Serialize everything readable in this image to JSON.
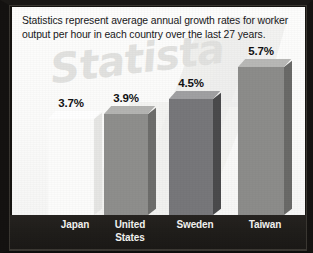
{
  "caption": "Statistics represent average annual growth rates for worker output per hour in each country over the last 27 years.",
  "watermark": "Statista",
  "chart_data": {
    "type": "bar",
    "title": "",
    "subtitle": "",
    "xlabel": "",
    "ylabel": "",
    "unit": "%",
    "grid": false,
    "legend": null,
    "ylim": [
      0,
      6.4
    ],
    "categories": [
      "Japan",
      "United States",
      "Sweden",
      "Taiwan"
    ],
    "values": [
      3.7,
      3.9,
      4.5,
      5.7
    ],
    "value_labels": [
      "3.7%",
      "3.9%",
      "4.5%",
      "5.7%"
    ],
    "bars": [
      {
        "category": "Japan",
        "label_line1": "Japan",
        "label_line2": "",
        "value": 3.7,
        "value_label": "3.7%",
        "x": 36,
        "width": 46,
        "height": 96,
        "face_color": "#fcfcfb",
        "top_color": "#ffffff",
        "side_color": "#e6e6e4"
      },
      {
        "category": "United States",
        "label_line1": "United",
        "label_line2": "States",
        "value": 3.9,
        "value_label": "3.9%",
        "x": 92,
        "width": 44,
        "height": 101,
        "face_color": "#8e8e8c",
        "top_color": "#b4b4b2",
        "side_color": "#6d6d6b"
      },
      {
        "category": "Sweden",
        "label_line1": "Sweden",
        "label_line2": "",
        "value": 4.5,
        "value_label": "4.5%",
        "x": 157,
        "width": 44,
        "height": 116,
        "face_color": "#77777a",
        "top_color": "#a0a0a2",
        "side_color": "#4a4a4c"
      },
      {
        "category": "Taiwan",
        "label_line1": "Taiwan",
        "label_line2": "",
        "value": 5.7,
        "value_label": "5.7%",
        "x": 226,
        "width": 46,
        "height": 148,
        "face_color": "#8c8c8a",
        "top_color": "#b8b8b6",
        "side_color": "#6a6a68"
      }
    ],
    "colors": {
      "panel_background": "#fbfbfa",
      "footer_background": "#201e1b",
      "frame": "#161411",
      "value_text": "#121214",
      "axis_text": "#f3f3f1",
      "watermark": "#e2e2e0"
    }
  }
}
